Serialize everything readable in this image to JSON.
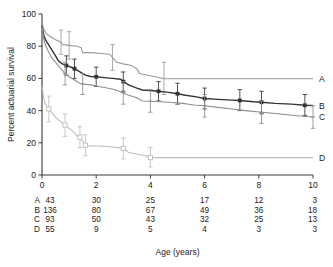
{
  "chart_data": {
    "type": "line",
    "title": "",
    "xlabel": "Age (years)",
    "ylabel": "Percent actuarial survival",
    "xlim": [
      0,
      10
    ],
    "ylim": [
      0,
      100
    ],
    "xticks": [
      0,
      2,
      4,
      6,
      8,
      10
    ],
    "yticks": [
      0,
      20,
      40,
      60,
      80,
      100
    ],
    "grid": false,
    "legend_position": "right-end-of-curve",
    "series": [
      {
        "name": "A",
        "label": "A",
        "color": "#9a9a9a",
        "marker": "none",
        "points": [
          [
            0.0,
            94
          ],
          [
            0.08,
            90
          ],
          [
            0.15,
            88
          ],
          [
            0.3,
            86
          ],
          [
            0.5,
            84
          ],
          [
            0.7,
            82.5
          ],
          [
            0.75,
            81
          ],
          [
            1.0,
            80.5
          ],
          [
            1.3,
            80
          ],
          [
            1.45,
            79
          ],
          [
            1.5,
            76
          ],
          [
            1.8,
            76
          ],
          [
            2.2,
            75.5
          ],
          [
            2.5,
            75
          ],
          [
            2.6,
            73
          ],
          [
            2.75,
            70
          ],
          [
            3.0,
            69
          ],
          [
            3.3,
            68
          ],
          [
            3.5,
            66
          ],
          [
            3.6,
            63
          ],
          [
            3.9,
            62
          ],
          [
            4.2,
            61
          ],
          [
            4.5,
            59.8
          ],
          [
            10.0,
            59.8
          ]
        ],
        "error_bars": [
          {
            "x": 0.7,
            "y": 82.5,
            "lo": 75,
            "hi": 90
          },
          {
            "x": 1.0,
            "y": 80.5,
            "lo": 72,
            "hi": 89
          },
          {
            "x": 2.6,
            "y": 73,
            "lo": 65,
            "hi": 81
          },
          {
            "x": 4.5,
            "y": 59.8,
            "lo": 50,
            "hi": 70
          }
        ]
      },
      {
        "name": "B",
        "label": "B",
        "color": "#333333",
        "marker": "filled-square",
        "points": [
          [
            0.0,
            93
          ],
          [
            0.05,
            88
          ],
          [
            0.1,
            85
          ],
          [
            0.2,
            82
          ],
          [
            0.35,
            78
          ],
          [
            0.5,
            74
          ],
          [
            0.6,
            71
          ],
          [
            0.75,
            69
          ],
          [
            0.9,
            68
          ],
          [
            1.0,
            67.5
          ],
          [
            1.2,
            66
          ],
          [
            1.4,
            64
          ],
          [
            1.6,
            62
          ],
          [
            1.8,
            61.2
          ],
          [
            2.0,
            61
          ],
          [
            2.3,
            60.5
          ],
          [
            2.6,
            60
          ],
          [
            2.9,
            59.5
          ],
          [
            3.0,
            58
          ],
          [
            3.2,
            56
          ],
          [
            3.5,
            54
          ],
          [
            3.7,
            52.8
          ],
          [
            4.0,
            52.5
          ],
          [
            4.3,
            52
          ],
          [
            4.6,
            51.5
          ],
          [
            5.0,
            50.5
          ],
          [
            5.3,
            49.5
          ],
          [
            5.7,
            48.5
          ],
          [
            6.0,
            47.5
          ],
          [
            6.5,
            47
          ],
          [
            7.0,
            46.5
          ],
          [
            7.3,
            46.3
          ],
          [
            7.8,
            45.5
          ],
          [
            8.1,
            45.2
          ],
          [
            8.6,
            44.5
          ],
          [
            9.2,
            44
          ],
          [
            9.7,
            43.3
          ],
          [
            10.0,
            43.2
          ]
        ],
        "error_bars": [
          {
            "x": 0.9,
            "y": 68,
            "lo": 62,
            "hi": 74
          },
          {
            "x": 1.2,
            "y": 66,
            "lo": 60,
            "hi": 72
          },
          {
            "x": 2.0,
            "y": 61,
            "lo": 55,
            "hi": 67
          },
          {
            "x": 3.0,
            "y": 58,
            "lo": 52,
            "hi": 64
          },
          {
            "x": 4.3,
            "y": 52,
            "lo": 46,
            "hi": 58
          },
          {
            "x": 5.0,
            "y": 50.5,
            "lo": 44,
            "hi": 57
          },
          {
            "x": 6.0,
            "y": 47.5,
            "lo": 41,
            "hi": 54
          },
          {
            "x": 7.3,
            "y": 46.3,
            "lo": 40,
            "hi": 53
          },
          {
            "x": 8.1,
            "y": 45.2,
            "lo": 38,
            "hi": 52
          },
          {
            "x": 9.7,
            "y": 43.3,
            "lo": 37,
            "hi": 50
          }
        ]
      },
      {
        "name": "C",
        "label": "C",
        "color": "#8d8d8d",
        "marker": "small-plus",
        "points": [
          [
            0.0,
            93
          ],
          [
            0.05,
            86
          ],
          [
            0.1,
            82
          ],
          [
            0.2,
            78
          ],
          [
            0.35,
            73
          ],
          [
            0.5,
            70
          ],
          [
            0.7,
            66
          ],
          [
            0.85,
            63
          ],
          [
            1.0,
            61
          ],
          [
            1.2,
            59
          ],
          [
            1.4,
            57
          ],
          [
            1.5,
            56.5
          ],
          [
            1.8,
            56
          ],
          [
            2.1,
            55
          ],
          [
            2.4,
            54
          ],
          [
            2.7,
            53
          ],
          [
            3.0,
            51
          ],
          [
            3.2,
            49.5
          ],
          [
            3.5,
            48
          ],
          [
            3.7,
            46
          ],
          [
            4.0,
            45.8
          ],
          [
            4.4,
            45.5
          ],
          [
            4.8,
            45
          ],
          [
            5.2,
            44.5
          ],
          [
            5.6,
            43.5
          ],
          [
            6.0,
            43
          ],
          [
            6.5,
            42
          ],
          [
            7.0,
            41
          ],
          [
            7.5,
            40
          ],
          [
            8.1,
            39
          ],
          [
            8.7,
            38
          ],
          [
            9.3,
            37
          ],
          [
            10.0,
            36
          ]
        ],
        "error_bars": [
          {
            "x": 0.85,
            "y": 63,
            "lo": 56,
            "hi": 70
          },
          {
            "x": 1.5,
            "y": 56.5,
            "lo": 50,
            "hi": 63
          },
          {
            "x": 3.0,
            "y": 51,
            "lo": 44,
            "hi": 58
          },
          {
            "x": 4.0,
            "y": 45.8,
            "lo": 39,
            "hi": 53
          },
          {
            "x": 6.0,
            "y": 43,
            "lo": 36,
            "hi": 50
          },
          {
            "x": 8.1,
            "y": 39,
            "lo": 32,
            "hi": 46
          },
          {
            "x": 10.0,
            "y": 36,
            "lo": 29,
            "hi": 43
          }
        ]
      },
      {
        "name": "D",
        "label": "D",
        "color": "#bdbdbd",
        "marker": "open-square",
        "points": [
          [
            0.0,
            55
          ],
          [
            0.03,
            52
          ],
          [
            0.06,
            48
          ],
          [
            0.1,
            45
          ],
          [
            0.15,
            43
          ],
          [
            0.25,
            41
          ],
          [
            0.4,
            38
          ],
          [
            0.55,
            35
          ],
          [
            0.7,
            33
          ],
          [
            0.85,
            31
          ],
          [
            1.0,
            29
          ],
          [
            1.15,
            27
          ],
          [
            1.3,
            24
          ],
          [
            1.4,
            23.5
          ],
          [
            1.5,
            21
          ],
          [
            1.6,
            18.5
          ],
          [
            1.8,
            18
          ],
          [
            2.1,
            18
          ],
          [
            2.5,
            17.5
          ],
          [
            2.8,
            17
          ],
          [
            3.0,
            16.5
          ],
          [
            3.2,
            14
          ],
          [
            3.5,
            13
          ],
          [
            3.8,
            12
          ],
          [
            4.0,
            10.8
          ],
          [
            10.0,
            10.8
          ]
        ],
        "error_bars": [
          {
            "x": 0.25,
            "y": 41,
            "lo": 33,
            "hi": 49
          },
          {
            "x": 0.85,
            "y": 31,
            "lo": 24,
            "hi": 38
          },
          {
            "x": 1.4,
            "y": 23.5,
            "lo": 17,
            "hi": 30
          },
          {
            "x": 1.6,
            "y": 18.5,
            "lo": 12,
            "hi": 25
          },
          {
            "x": 3.0,
            "y": 16.5,
            "lo": 10,
            "hi": 23
          },
          {
            "x": 4.0,
            "y": 10.8,
            "lo": 5,
            "hi": 17
          }
        ]
      }
    ],
    "at_risk_table": {
      "x_positions": [
        0,
        2,
        4,
        6,
        8,
        10
      ],
      "rows": [
        {
          "label": "A",
          "values": [
            "43",
            "30",
            "25",
            "17",
            "12",
            "3"
          ]
        },
        {
          "label": "B",
          "values": [
            "136",
            "80",
            "67",
            "49",
            "36",
            "18"
          ]
        },
        {
          "label": "C",
          "values": [
            "93",
            "50",
            "43",
            "32",
            "25",
            "13"
          ]
        },
        {
          "label": "D",
          "values": [
            "55",
            "9",
            "5",
            "4",
            "3",
            "3"
          ]
        }
      ]
    }
  }
}
